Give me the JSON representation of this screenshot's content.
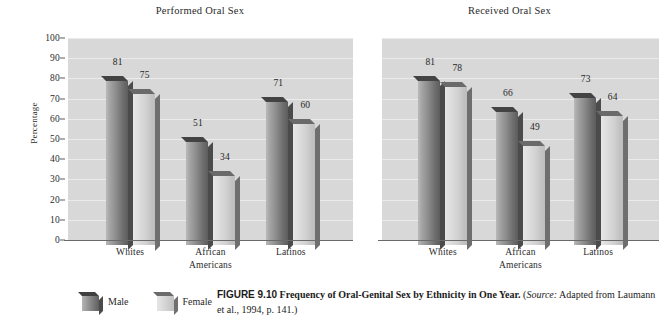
{
  "figure": {
    "number_label": "FIGURE 9.10",
    "title": "Frequency of Oral-Genital Sex by Ethnicity in One Year.",
    "source_open": "(",
    "source_lead": "Source:",
    "source_text": " Adapted from Laumann et al., 1994, p. 141.)"
  },
  "legend": {
    "items": [
      {
        "label": "Male",
        "swatch": "male-swatch-icon",
        "color": "#8d8d8d"
      },
      {
        "label": "Female",
        "swatch": "female-swatch-icon",
        "color": "#d4d4d4"
      }
    ]
  },
  "axis": {
    "ylabel": "Percentage",
    "yticks": [
      "0",
      "10",
      "20",
      "30",
      "40",
      "50",
      "60",
      "70",
      "80",
      "90",
      "100"
    ],
    "ymin": 0,
    "ymax": 100
  },
  "chart_data": [
    {
      "type": "bar",
      "title": "Performed Oral Sex",
      "xlabel": "",
      "ylabel": "Percentage",
      "ylim": [
        0,
        100
      ],
      "ytick_step": 10,
      "grid": true,
      "legend_position": "below-figure",
      "categories": [
        "Whites",
        "African Americans",
        "Latinos"
      ],
      "series": [
        {
          "name": "Male",
          "values": [
            81,
            51,
            71
          ]
        },
        {
          "name": "Female",
          "values": [
            75,
            34,
            60
          ]
        }
      ]
    },
    {
      "type": "bar",
      "title": "Received Oral Sex",
      "xlabel": "",
      "ylabel": "Percentage",
      "ylim": [
        0,
        100
      ],
      "ytick_step": 10,
      "grid": true,
      "legend_position": "below-figure",
      "categories": [
        "Whites",
        "African Americans",
        "Latinos"
      ],
      "series": [
        {
          "name": "Male",
          "values": [
            81,
            66,
            73
          ]
        },
        {
          "name": "Female",
          "values": [
            78,
            49,
            64
          ]
        }
      ]
    }
  ],
  "category_labels": [
    {
      "line1": "Whites",
      "line2": ""
    },
    {
      "line1": "African",
      "line2": "Americans"
    },
    {
      "line1": "Latinos",
      "line2": ""
    }
  ]
}
